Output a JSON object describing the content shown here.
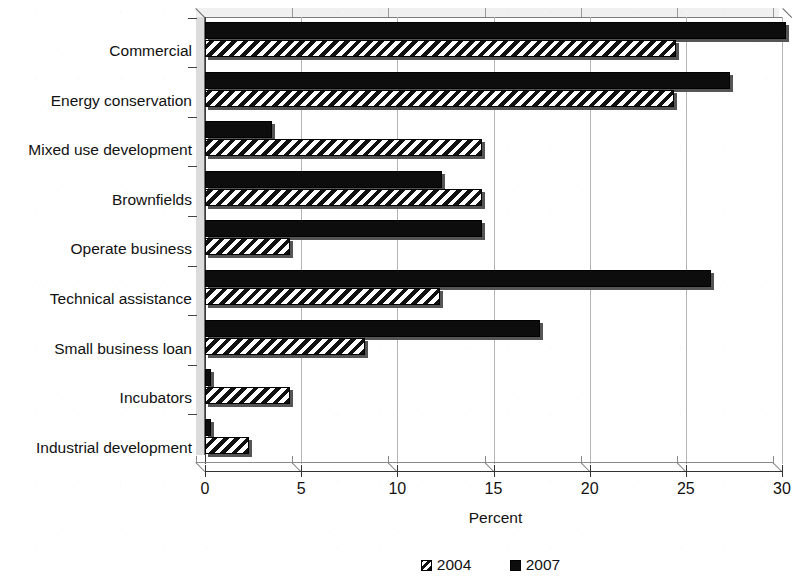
{
  "chart_data": {
    "type": "bar",
    "orientation": "horizontal",
    "title": "",
    "xlabel": "Percent",
    "ylabel": "",
    "xlim": [
      0,
      30
    ],
    "xticks": [
      0,
      5,
      10,
      15,
      20,
      25,
      30
    ],
    "xtick_labels": [
      "0",
      "5",
      "10",
      "15",
      "20",
      "25",
      "30"
    ],
    "grid": true,
    "grid_axis": "x",
    "legend_position": "bottom",
    "categories": [
      "Commercial",
      "Energy conservation",
      "Mixed use development",
      "Brownfields",
      "Operate business",
      "Technical assistance",
      "Small business loan",
      "Incubators",
      "Industrial development"
    ],
    "series": [
      {
        "name": "2004",
        "pattern": "hatched",
        "color": "#ffffff",
        "values": [
          24.5,
          24.4,
          14.4,
          14.4,
          4.4,
          12.2,
          8.3,
          4.4,
          2.3
        ]
      },
      {
        "name": "2007",
        "pattern": "solid",
        "color": "#0d0d0d",
        "values": [
          30.2,
          27.3,
          3.5,
          12.3,
          14.4,
          26.3,
          17.4,
          0.3,
          0.3
        ]
      }
    ]
  },
  "legend": {
    "items": [
      {
        "label": "2004",
        "swatch": "hatched-square-icon"
      },
      {
        "label": "2007",
        "swatch": "solid-square-icon"
      }
    ]
  },
  "axis": {
    "x_title": "Percent"
  }
}
